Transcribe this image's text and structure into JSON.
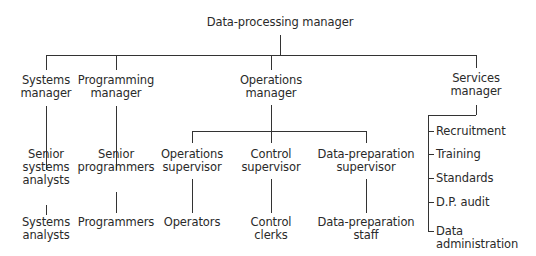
{
  "diagram": {
    "type": "org-chart",
    "root": "Data-processing manager",
    "managers": {
      "systems": "Systems\nmanager",
      "programming": "Programming\nmanager",
      "operations": "Operations\nmanager",
      "services": "Services\nmanager"
    },
    "systems_branch": [
      "Senior\nsystems\nanalysts",
      "Systems\nanalysts"
    ],
    "programming_branch": [
      "Senior\nprogrammers",
      "Programmers"
    ],
    "operations_branch": {
      "supervisors": [
        "Operations\nsupervisor",
        "Control\nsupervisor",
        "Data-preparation\nsupervisor"
      ],
      "staff": [
        "Operators",
        "Control\nclerks",
        "Data-preparation\nstaff"
      ]
    },
    "services_branch": [
      "Recruitment",
      "Training",
      "Standards",
      "D.P. audit",
      "Data\nadministration"
    ]
  }
}
